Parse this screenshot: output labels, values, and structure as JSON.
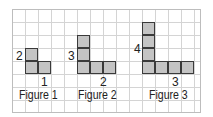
{
  "figures": [
    {
      "caption": "Figure 1",
      "height_label": "2",
      "width_label": "1"
    },
    {
      "caption": "Figure 2",
      "height_label": "3",
      "width_label": "2"
    },
    {
      "caption": "Figure 3",
      "height_label": "4",
      "width_label": "3"
    }
  ],
  "colors": {
    "square_fill": "#c4c4c4",
    "square_border": "#3a3a3a",
    "grid_line": "#d4d4d4"
  }
}
